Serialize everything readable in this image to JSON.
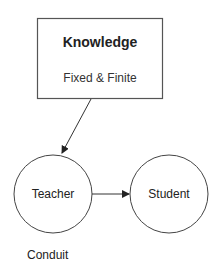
{
  "diagram": {
    "knowledge_box": {
      "title": "Knowledge",
      "subtitle": "Fixed & Finite"
    },
    "nodes": [
      {
        "id": "teacher",
        "label": "Teacher"
      },
      {
        "id": "student",
        "label": "Student"
      }
    ],
    "edges": [
      {
        "from": "knowledge",
        "to": "teacher"
      },
      {
        "from": "teacher",
        "to": "student"
      }
    ],
    "caption": "Conduit",
    "colors": {
      "stroke": "#444444",
      "text": "#222222",
      "background": "#ffffff"
    }
  }
}
